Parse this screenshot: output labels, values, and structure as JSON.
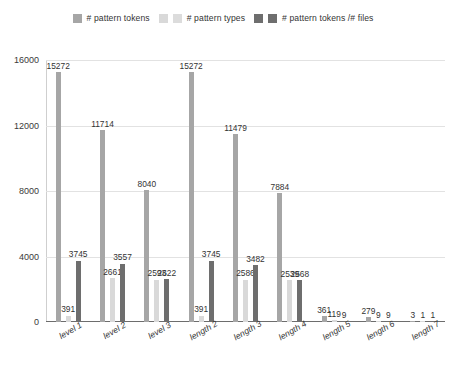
{
  "chart_data": {
    "type": "bar",
    "title": "",
    "xlabel": "",
    "ylabel": "",
    "ylim": [
      0,
      16000
    ],
    "grid": true,
    "legend_position": "top",
    "yticks": [
      "0",
      "4000",
      "8000",
      "12000",
      "16000"
    ],
    "categories": [
      "level 1",
      "level 2",
      "level 3",
      "length 2",
      "length 3",
      "length 4",
      "length 5",
      "length 6",
      "length 7"
    ],
    "series": [
      {
        "name": "# pattern tokens",
        "color": "#a6a6a6",
        "values": [
          15272,
          11714,
          8040,
          15272,
          11479,
          7884,
          361,
          279,
          3
        ]
      },
      {
        "name": "# pattern types",
        "color": "#d9d9d9",
        "values": [
          391,
          2661,
          2593,
          391,
          2586,
          2539,
          119,
          9,
          1
        ]
      },
      {
        "name": "# pattern tokens /# files",
        "color": "#6e6e6e",
        "values": [
          3745,
          3557,
          2622,
          3745,
          3482,
          2568,
          9,
          9,
          1
        ]
      }
    ]
  },
  "legend": {
    "entries": [
      {
        "label": "# pattern tokens",
        "color": "#a6a6a6",
        "pair_color": "#d9d9d9"
      },
      {
        "label": "# pattern types",
        "color": "#dcdcdc",
        "pair_color": "#6e6e6e"
      },
      {
        "label": "# pattern tokens /# files",
        "color": "#6e6e6e",
        "pair_color": "#6e6e6e"
      }
    ]
  },
  "colors": {
    "series1": "#a6a6a6",
    "series2": "#d9d9d9",
    "series3": "#6e6e6e",
    "grid": "#e2e2e2",
    "axis": "#6d6d6d",
    "text": "#3a3a3a",
    "background": "#ffffff"
  }
}
